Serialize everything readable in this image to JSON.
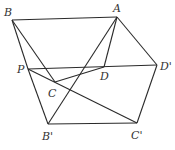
{
  "diagram": {
    "type": "geometry-figure",
    "points": {
      "A": {
        "x": 117,
        "y": 17
      },
      "B": {
        "x": 12,
        "y": 20
      },
      "P": {
        "x": 28,
        "y": 69
      },
      "C": {
        "x": 55,
        "y": 82
      },
      "D": {
        "x": 104,
        "y": 67
      },
      "D'": {
        "x": 157,
        "y": 65
      },
      "B'": {
        "x": 48,
        "y": 124
      },
      "C'": {
        "x": 137,
        "y": 123
      }
    },
    "edges": [
      [
        "B",
        "A"
      ],
      [
        "B",
        "P"
      ],
      [
        "B",
        "C"
      ],
      [
        "P",
        "B'"
      ],
      [
        "P",
        "D'"
      ],
      [
        "P",
        "C'"
      ],
      [
        "C",
        "D"
      ],
      [
        "A",
        "D"
      ],
      [
        "A",
        "B'"
      ],
      [
        "A",
        "D'"
      ],
      [
        "D'",
        "C'"
      ],
      [
        "B'",
        "C'"
      ]
    ],
    "labels": [
      {
        "text": "A",
        "x": 113,
        "y": 12
      },
      {
        "text": "B",
        "x": 4,
        "y": 16
      },
      {
        "text": "P",
        "x": 17,
        "y": 73
      },
      {
        "text": "C",
        "x": 48,
        "y": 97
      },
      {
        "text": "D",
        "x": 100,
        "y": 80
      },
      {
        "text": "D'",
        "x": 160,
        "y": 70
      },
      {
        "text": "B'",
        "x": 42,
        "y": 140
      },
      {
        "text": "C'",
        "x": 131,
        "y": 139
      }
    ]
  }
}
